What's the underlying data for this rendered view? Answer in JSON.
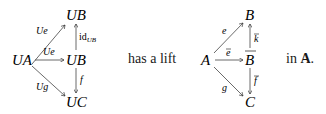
{
  "left_diagram": {
    "nodes": {
      "top": "UB",
      "left": "UA",
      "middle": "UB",
      "bottom": "UC"
    },
    "edges": {
      "diag_up": "Ue",
      "horizontal": "Ue",
      "vertical_up": "id",
      "vertical_up_sub": "UB",
      "vertical_down": "f",
      "diag_down": "Ug"
    }
  },
  "connective_text": "has a lift",
  "right_diagram": {
    "nodes": {
      "top": "B",
      "left": "A",
      "middle": "B",
      "bottom": "C"
    },
    "edges": {
      "diag_up": "e",
      "horizontal": "e",
      "vertical_up": "k",
      "vertical_down": "f",
      "diag_down": "g"
    }
  },
  "suffix_text": {
    "prefix": "in",
    "category": "A",
    "period": "."
  }
}
